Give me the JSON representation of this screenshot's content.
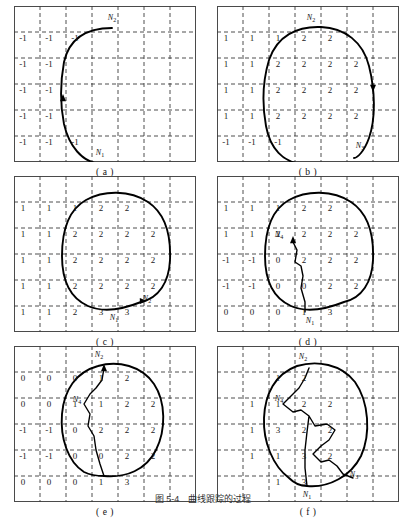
{
  "figure": {
    "caption": "图 5-4　曲线跟踪的过程",
    "page_width": 406,
    "page_height": 503,
    "grid": {
      "cols": 7,
      "rows": 6,
      "cell": 26,
      "line_color": "#3a3a3a",
      "border_color": "#4a4a4a"
    },
    "curve_color": "#000000"
  },
  "panels": [
    {
      "id": "a",
      "caption": "( a )",
      "numbers": [
        {
          "text": "-1",
          "col": 0,
          "row": 1
        },
        {
          "text": "-1",
          "col": 1,
          "row": 1
        },
        {
          "text": "-1",
          "col": 2,
          "row": 1
        },
        {
          "text": "-1",
          "col": 0,
          "row": 2
        },
        {
          "text": "-1",
          "col": 1,
          "row": 2
        },
        {
          "text": "-1",
          "col": 0,
          "row": 3
        },
        {
          "text": "-1",
          "col": 1,
          "row": 3
        },
        {
          "text": "-1",
          "col": 0,
          "row": 4
        },
        {
          "text": "-1",
          "col": 1,
          "row": 4
        },
        {
          "text": "-1",
          "col": 0,
          "row": 5
        },
        {
          "text": "-1",
          "col": 1,
          "row": 5
        },
        {
          "text": "-1",
          "col": 2,
          "row": 5
        }
      ],
      "labels": [
        {
          "name": "N2",
          "base": "N",
          "sub": "2",
          "x": 98,
          "y": 13
        },
        {
          "name": "N1",
          "base": "N",
          "sub": "1",
          "x": 86,
          "y": 148
        }
      ],
      "path": "M 86,158 C 68,156 55,140 50,118 C 46,98 46,78 50,56 C 55,34 70,22 98,22",
      "arrow": {
        "x": 49,
        "y": 92,
        "dir": "up"
      }
    },
    {
      "id": "b",
      "caption": "( b )",
      "numbers": [
        {
          "text": "1",
          "col": 0,
          "row": 1
        },
        {
          "text": "1",
          "col": 1,
          "row": 1
        },
        {
          "text": "1",
          "col": 2,
          "row": 1
        },
        {
          "text": "2",
          "col": 3,
          "row": 1
        },
        {
          "text": "2",
          "col": 4,
          "row": 1
        },
        {
          "text": "1",
          "col": 0,
          "row": 2
        },
        {
          "text": "1",
          "col": 1,
          "row": 2
        },
        {
          "text": "2",
          "col": 2,
          "row": 2
        },
        {
          "text": "2",
          "col": 3,
          "row": 2
        },
        {
          "text": "2",
          "col": 4,
          "row": 2
        },
        {
          "text": "2",
          "col": 5,
          "row": 2
        },
        {
          "text": "1",
          "col": 0,
          "row": 3
        },
        {
          "text": "1",
          "col": 1,
          "row": 3
        },
        {
          "text": "2",
          "col": 2,
          "row": 3
        },
        {
          "text": "2",
          "col": 3,
          "row": 3
        },
        {
          "text": "2",
          "col": 4,
          "row": 3
        },
        {
          "text": "2",
          "col": 5,
          "row": 3
        },
        {
          "text": "1",
          "col": 0,
          "row": 4
        },
        {
          "text": "1",
          "col": 1,
          "row": 4
        },
        {
          "text": "2",
          "col": 2,
          "row": 4
        },
        {
          "text": "2",
          "col": 3,
          "row": 4
        },
        {
          "text": "2",
          "col": 4,
          "row": 4
        },
        {
          "text": "2",
          "col": 5,
          "row": 4
        },
        {
          "text": "-1",
          "col": 0,
          "row": 5
        },
        {
          "text": "-1",
          "col": 1,
          "row": 5
        },
        {
          "text": "-1",
          "col": 2,
          "row": 5
        }
      ],
      "labels": [
        {
          "name": "N2",
          "base": "N",
          "sub": "2",
          "x": 94,
          "y": 13
        },
        {
          "name": "N3",
          "base": "N",
          "sub": "3",
          "x": 143,
          "y": 141
        }
      ],
      "path": "M 86,158 C 66,157 53,142 49,120 C 45,98 46,74 52,54 C 60,30 80,20 104,21 C 128,22 146,36 152,60 C 158,84 159,112 152,132 C 147,146 140,152 137,152",
      "arrow": {
        "x": 156,
        "y": 82,
        "dir": "down"
      }
    },
    {
      "id": "c",
      "caption": "( c )",
      "numbers": [
        {
          "text": "1",
          "col": 0,
          "row": 1
        },
        {
          "text": "1",
          "col": 1,
          "row": 1
        },
        {
          "text": "1",
          "col": 2,
          "row": 1
        },
        {
          "text": "2",
          "col": 3,
          "row": 1
        },
        {
          "text": "2",
          "col": 4,
          "row": 1
        },
        {
          "text": "1",
          "col": 0,
          "row": 2
        },
        {
          "text": "1",
          "col": 1,
          "row": 2
        },
        {
          "text": "2",
          "col": 2,
          "row": 2
        },
        {
          "text": "2",
          "col": 3,
          "row": 2
        },
        {
          "text": "2",
          "col": 4,
          "row": 2
        },
        {
          "text": "2",
          "col": 5,
          "row": 2
        },
        {
          "text": "1",
          "col": 0,
          "row": 3
        },
        {
          "text": "1",
          "col": 1,
          "row": 3
        },
        {
          "text": "2",
          "col": 2,
          "row": 3
        },
        {
          "text": "2",
          "col": 3,
          "row": 3
        },
        {
          "text": "2",
          "col": 4,
          "row": 3
        },
        {
          "text": "2",
          "col": 5,
          "row": 3
        },
        {
          "text": "1",
          "col": 0,
          "row": 4
        },
        {
          "text": "1",
          "col": 1,
          "row": 4
        },
        {
          "text": "2",
          "col": 2,
          "row": 4
        },
        {
          "text": "2",
          "col": 3,
          "row": 4
        },
        {
          "text": "2",
          "col": 4,
          "row": 4
        },
        {
          "text": "2",
          "col": 5,
          "row": 4
        },
        {
          "text": "1",
          "col": 0,
          "row": 5
        },
        {
          "text": "1",
          "col": 1,
          "row": 5
        },
        {
          "text": "2",
          "col": 2,
          "row": 5
        },
        {
          "text": "3",
          "col": 3,
          "row": 5
        },
        {
          "text": "3",
          "col": 4,
          "row": 5
        }
      ],
      "labels": [
        {
          "name": "N1",
          "base": "N",
          "sub": "1",
          "x": 100,
          "y": 143
        },
        {
          "name": "N2",
          "base": "N",
          "sub": "2",
          "x": 133,
          "y": 124
        }
      ],
      "path": "M 127,126 C 145,122 155,106 156,84 C 157,60 152,38 134,26 C 116,14 90,14 72,24 C 54,34 48,54 48,80 C 48,104 56,122 74,130 C 92,138 112,132 127,126 Z",
      "arrow": {
        "x": 129,
        "y": 125,
        "dir": "right"
      }
    },
    {
      "id": "d",
      "caption": "( d )",
      "numbers": [
        {
          "text": "1",
          "col": 0,
          "row": 1
        },
        {
          "text": "1",
          "col": 1,
          "row": 1
        },
        {
          "text": "1",
          "col": 2,
          "row": 1
        },
        {
          "text": "2",
          "col": 3,
          "row": 1
        },
        {
          "text": "2",
          "col": 4,
          "row": 1
        },
        {
          "text": "1",
          "col": 0,
          "row": 2
        },
        {
          "text": "1",
          "col": 1,
          "row": 2
        },
        {
          "text": "2",
          "col": 2,
          "row": 2
        },
        {
          "text": "2",
          "col": 3,
          "row": 2
        },
        {
          "text": "2",
          "col": 4,
          "row": 2
        },
        {
          "text": "2",
          "col": 5,
          "row": 2
        },
        {
          "text": "-1",
          "col": 0,
          "row": 3
        },
        {
          "text": "-1",
          "col": 1,
          "row": 3
        },
        {
          "text": "0",
          "col": 2,
          "row": 3
        },
        {
          "text": "2",
          "col": 3,
          "row": 3
        },
        {
          "text": "2",
          "col": 4,
          "row": 3
        },
        {
          "text": "2",
          "col": 5,
          "row": 3
        },
        {
          "text": "-1",
          "col": 0,
          "row": 4
        },
        {
          "text": "-1",
          "col": 1,
          "row": 4
        },
        {
          "text": "0",
          "col": 2,
          "row": 4
        },
        {
          "text": "0",
          "col": 3,
          "row": 4
        },
        {
          "text": "2",
          "col": 4,
          "row": 4
        },
        {
          "text": "2",
          "col": 5,
          "row": 4
        },
        {
          "text": "0",
          "col": 0,
          "row": 5
        },
        {
          "text": "0",
          "col": 1,
          "row": 5
        },
        {
          "text": "0",
          "col": 2,
          "row": 5
        },
        {
          "text": "1",
          "col": 3,
          "row": 5
        },
        {
          "text": "3",
          "col": 4,
          "row": 5
        }
      ],
      "labels": [
        {
          "name": "N4",
          "base": "N",
          "sub": "4",
          "x": 62,
          "y": 60
        },
        {
          "name": "N1",
          "base": "N",
          "sub": "1",
          "x": 93,
          "y": 146
        }
      ],
      "path": "M 127,126 C 145,122 155,106 156,84 C 157,60 152,38 134,26 C 116,14 90,14 72,24 C 54,34 48,54 48,80 C 48,104 56,122 74,130 C 92,138 112,132 127,126 Z",
      "inner": "M 76,66 L 80,74 L 78,86 L 84,90 L 86,100 L 84,112 L 88,126 L 88,136",
      "arrow": {
        "x": 76,
        "y": 64,
        "dir": "up"
      }
    },
    {
      "id": "e",
      "caption": "( e )",
      "numbers": [
        {
          "text": "0",
          "col": 0,
          "row": 1
        },
        {
          "text": "0",
          "col": 1,
          "row": 1
        },
        {
          "text": "0",
          "col": 2,
          "row": 1
        },
        {
          "text": "1",
          "col": 3,
          "row": 1
        },
        {
          "text": "2",
          "col": 4,
          "row": 1
        },
        {
          "text": "0",
          "col": 0,
          "row": 2
        },
        {
          "text": "0",
          "col": 1,
          "row": 2
        },
        {
          "text": "1",
          "col": 2,
          "row": 2
        },
        {
          "text": "1",
          "col": 3,
          "row": 2
        },
        {
          "text": "2",
          "col": 4,
          "row": 2
        },
        {
          "text": "2",
          "col": 5,
          "row": 2
        },
        {
          "text": "-1",
          "col": 0,
          "row": 3
        },
        {
          "text": "-1",
          "col": 1,
          "row": 3
        },
        {
          "text": "0",
          "col": 2,
          "row": 3
        },
        {
          "text": "2",
          "col": 3,
          "row": 3
        },
        {
          "text": "2",
          "col": 4,
          "row": 3
        },
        {
          "text": "2",
          "col": 5,
          "row": 3
        },
        {
          "text": "-1",
          "col": 0,
          "row": 4
        },
        {
          "text": "-1",
          "col": 1,
          "row": 4
        },
        {
          "text": "0",
          "col": 2,
          "row": 4
        },
        {
          "text": "0",
          "col": 3,
          "row": 4
        },
        {
          "text": "2",
          "col": 4,
          "row": 4
        },
        {
          "text": "2",
          "col": 5,
          "row": 4
        },
        {
          "text": "0",
          "col": 0,
          "row": 5
        },
        {
          "text": "0",
          "col": 1,
          "row": 5
        },
        {
          "text": "0",
          "col": 2,
          "row": 5
        },
        {
          "text": "1",
          "col": 3,
          "row": 5
        },
        {
          "text": "3",
          "col": 4,
          "row": 5
        }
      ],
      "labels": [
        {
          "name": "N2",
          "base": "N",
          "sub": "2",
          "x": 85,
          "y": 10
        },
        {
          "name": "N4",
          "base": "N",
          "sub": "4",
          "x": 63,
          "y": 55
        }
      ],
      "path": "M 90,130 C 112,132 132,124 142,104 C 152,84 152,56 140,38 C 128,20 104,14 84,20 C 62,26 50,44 48,68 C 46,92 54,116 70,126 C 78,130 84,130 90,130 Z",
      "inner": "M 90,22 L 88,34 L 82,42 L 76,48 L 70,58 L 76,68 L 74,80 L 80,90 L 82,104 L 86,118 L 90,130",
      "arrow": {
        "x": 90,
        "y": 22,
        "dir": "up"
      }
    },
    {
      "id": "f",
      "caption": "( f )",
      "numbers": [
        {
          "text": "1",
          "col": 2,
          "row": 1
        },
        {
          "text": "2",
          "col": 3,
          "row": 1
        },
        {
          "text": "1",
          "col": 1,
          "row": 2
        },
        {
          "text": "1",
          "col": 2,
          "row": 2
        },
        {
          "text": "2",
          "col": 3,
          "row": 2
        },
        {
          "text": "2",
          "col": 4,
          "row": 2
        },
        {
          "text": "1",
          "col": 1,
          "row": 3
        },
        {
          "text": "3",
          "col": 2,
          "row": 3
        },
        {
          "text": "2",
          "col": 3,
          "row": 3
        },
        {
          "text": "2",
          "col": 4,
          "row": 3
        },
        {
          "text": "1",
          "col": 1,
          "row": 4
        },
        {
          "text": "1",
          "col": 2,
          "row": 4
        },
        {
          "text": "3",
          "col": 3,
          "row": 4
        },
        {
          "text": "2",
          "col": 4,
          "row": 4
        },
        {
          "text": "1",
          "col": 2,
          "row": 5
        },
        {
          "text": "3",
          "col": 3,
          "row": 5
        }
      ],
      "labels": [
        {
          "name": "N2",
          "base": "N",
          "sub": "2",
          "x": 86,
          "y": 12
        },
        {
          "name": "N4",
          "base": "N",
          "sub": "4",
          "x": 62,
          "y": 54
        },
        {
          "name": "N3",
          "base": "N",
          "sub": "3",
          "x": 137,
          "y": 130
        },
        {
          "name": "N1",
          "base": "N",
          "sub": "1",
          "x": 90,
          "y": 150
        }
      ],
      "path": "M 90,140 C 112,142 134,130 144,110 C 154,88 152,56 138,36 C 124,18 100,14 80,20 C 58,28 48,48 47,72 C 46,96 56,120 72,132 C 78,138 84,140 90,140 Z",
      "inner": "M 92,22 L 88,32 L 82,42 L 74,50 L 66,58 L 76,66 L 84,64 L 92,70 L 98,80 L 110,78 L 118,84 L 112,94 L 104,100 L 96,108 L 104,116 L 112,114 L 120,120 L 126,128 L 136,132 M 92,70 L 90,86 L 88,104 L 88,122 L 90,140",
      "arrow": null
    }
  ]
}
